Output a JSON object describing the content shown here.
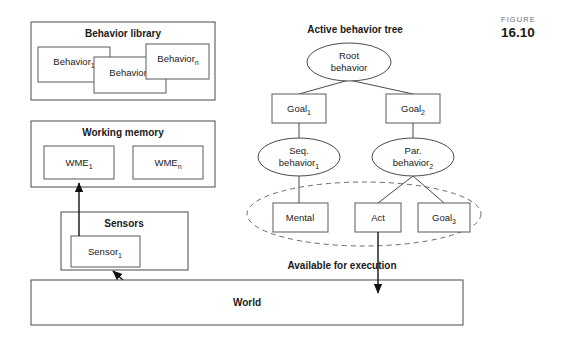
{
  "figure": {
    "word": "FIGURE",
    "number": "16.10"
  },
  "left_column": {
    "behavior_library": {
      "title": "Behavior library",
      "items": [
        {
          "label": "Behavior",
          "sub": "1"
        },
        {
          "label": "Behavior",
          "sub": "2"
        },
        {
          "label": "Behavior",
          "sub": "n"
        }
      ]
    },
    "working_memory": {
      "title": "Working memory",
      "items": [
        {
          "label": "WME",
          "sub": "1"
        },
        {
          "label": "WME",
          "sub": "n"
        }
      ]
    },
    "sensors": {
      "title": "Sensors",
      "items": [
        {
          "label": "Sensor",
          "sub": "1"
        }
      ]
    }
  },
  "world": {
    "label": "World"
  },
  "tree": {
    "title": "Active behavior tree",
    "available_label": "Available for execution",
    "nodes": {
      "root": {
        "line1": "Root",
        "line2": "behavior"
      },
      "goal1": {
        "label": "Goal",
        "sub": "1"
      },
      "goal2": {
        "label": "Goal",
        "sub": "2"
      },
      "seq": {
        "line1": "Seq.",
        "line2": "behavior",
        "sub": "1"
      },
      "par": {
        "line1": "Par.",
        "line2": "behavior",
        "sub": "2"
      },
      "mental": {
        "label": "Mental",
        "sub": ""
      },
      "act": {
        "label": "Act",
        "sub": ""
      },
      "goal3": {
        "label": "Goal",
        "sub": "3"
      }
    }
  },
  "colors": {
    "stroke": "#4a4a4a",
    "arrow": "#111111",
    "dashed": "#6a6a6a",
    "background": "#ffffff",
    "caption_word": "#6f6f6f",
    "caption_num": "#1a1a1a"
  }
}
